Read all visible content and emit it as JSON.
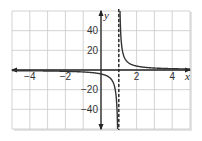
{
  "chart_data": {
    "type": "line",
    "title": "",
    "xlabel": "x",
    "ylabel": "y",
    "xlim": [
      -5,
      5
    ],
    "ylim": [
      -60,
      60
    ],
    "grid": true,
    "x_grid_step": 1,
    "y_grid_step": 20,
    "x_ticks": [
      -4,
      -2,
      2,
      4
    ],
    "x_tick_labels": [
      "−4",
      "−2",
      "2",
      "4"
    ],
    "y_ticks": [
      40,
      20,
      -20,
      -40
    ],
    "y_tick_labels": [
      "40",
      "20",
      "−20",
      "−40"
    ],
    "series": [
      {
        "name": "y = 4/(x − 1)",
        "function": "4/(x-1)",
        "branches": [
          {
            "x": [
              -5,
              -4,
              -3,
              -2,
              -1,
              0,
              0.5,
              0.8,
              0.9,
              0.93
            ],
            "y": [
              -0.67,
              -0.8,
              -1,
              -1.33,
              -2,
              -4,
              -8,
              -20,
              -40,
              -57
            ]
          },
          {
            "x": [
              1.07,
              1.1,
              1.2,
              1.5,
              2,
              3,
              4,
              5
            ],
            "y": [
              57,
              40,
              20,
              8,
              4,
              2,
              1.33,
              1
            ]
          }
        ],
        "color": "#333333"
      }
    ],
    "asymptotes": [
      {
        "type": "vertical",
        "x": 1,
        "style": "dashed"
      },
      {
        "type": "horizontal",
        "y": 0,
        "style": "axis"
      }
    ],
    "legend": null
  },
  "colors": {
    "grid": "#c8c8c8",
    "axis": "#222222",
    "curve": "#333333",
    "shadow": "#d6d6d6"
  }
}
